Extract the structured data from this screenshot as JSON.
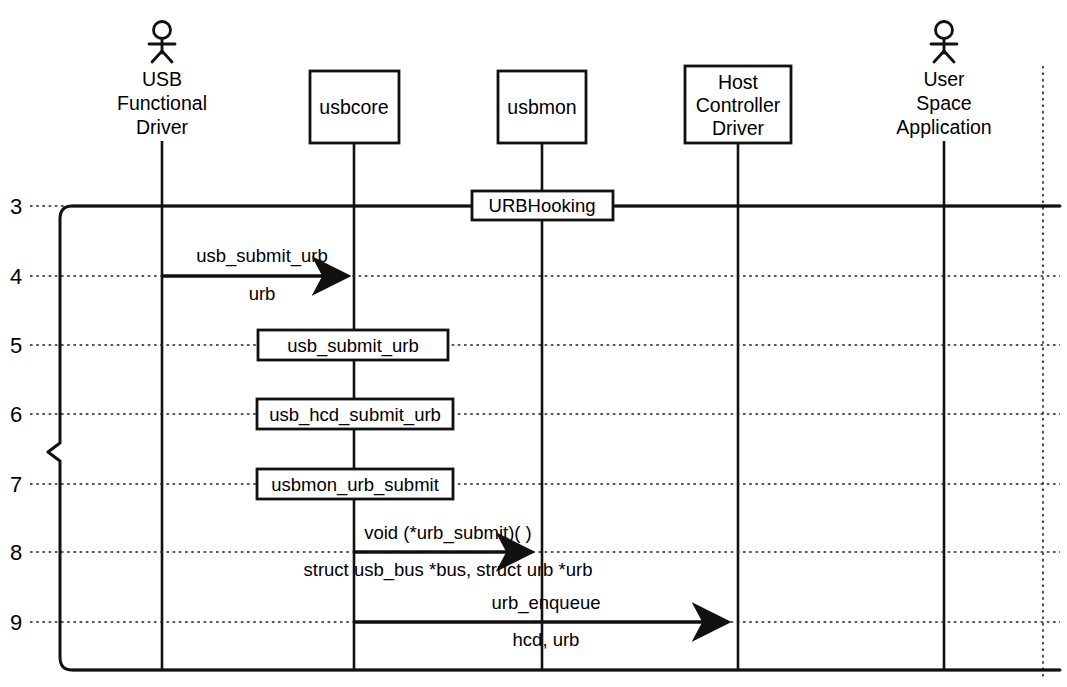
{
  "diagram": {
    "type": "uml-sequence-diagram",
    "colors": {
      "stroke": "#111111",
      "background": "#ffffff",
      "gridline": "#222222"
    },
    "participants": [
      {
        "id": "usb_functional_driver",
        "kind": "actor",
        "lines": [
          "USB",
          "Functional",
          "Driver"
        ],
        "x": 162
      },
      {
        "id": "usbcore",
        "kind": "object",
        "lines": [
          "usbcore"
        ],
        "x": 354
      },
      {
        "id": "usbmon",
        "kind": "object",
        "lines": [
          "usbmon"
        ],
        "x": 542
      },
      {
        "id": "host_controller_driver",
        "kind": "object",
        "lines": [
          "Host",
          "Controller",
          "Driver"
        ],
        "x": 738
      },
      {
        "id": "user_space_application",
        "kind": "actor",
        "lines": [
          "User",
          "Space",
          "Application"
        ],
        "x": 944
      }
    ],
    "rows": [
      {
        "number": "3",
        "y": 206,
        "style": "solid"
      },
      {
        "number": "4",
        "y": 276,
        "style": "dotted"
      },
      {
        "number": "5",
        "y": 345,
        "style": "dotted"
      },
      {
        "number": "6",
        "y": 414,
        "style": "dotted"
      },
      {
        "number": "7",
        "y": 484,
        "style": "dotted"
      },
      {
        "number": "8",
        "y": 552,
        "style": "dotted"
      },
      {
        "number": "9",
        "y": 622,
        "style": "dotted"
      }
    ],
    "row_numbers": [
      "3",
      "4",
      "5",
      "6",
      "7",
      "8",
      "9"
    ],
    "stereotype_box": {
      "label": "URBHooking",
      "row": "3",
      "on": "usbmon"
    },
    "messages": [
      {
        "row": "4",
        "kind": "arrow",
        "from": "usb_functional_driver",
        "to": "usbcore",
        "above_label": "usb_submit_urb",
        "below_label": "urb"
      },
      {
        "row": "5",
        "kind": "box",
        "on": "usbcore",
        "label": "usb_submit_urb"
      },
      {
        "row": "6",
        "kind": "box",
        "on": "usbcore",
        "label": "usb_hcd_submit_urb"
      },
      {
        "row": "7",
        "kind": "box",
        "on": "usbcore",
        "label": "usbmon_urb_submit"
      },
      {
        "row": "8",
        "kind": "arrow",
        "from": "usbcore",
        "to": "usbmon",
        "above_label": "void (*urb_submit)( )",
        "below_label": "struct usb_bus *bus, struct urb *urb"
      },
      {
        "row": "9",
        "kind": "arrow",
        "from": "usbcore",
        "to": "host_controller_driver",
        "above_label": "urb_enqueue",
        "below_label": "hcd, urb"
      }
    ],
    "grouping_brace": {
      "present": true,
      "from_row": "3",
      "to_row": "9",
      "notch_y": 450
    }
  }
}
